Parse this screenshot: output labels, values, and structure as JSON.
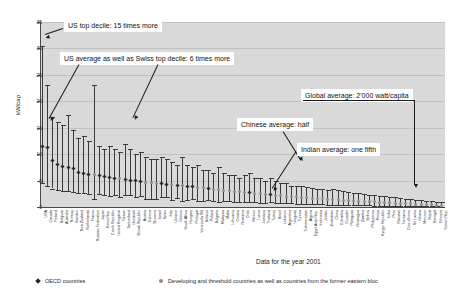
{
  "chart_data": {
    "type": "bar",
    "title": "",
    "subtitle": "",
    "xlabel": "",
    "ylabel": "kW/cap",
    "ylim": [
      0,
      35
    ],
    "yticks": [
      0,
      5,
      10,
      15,
      20,
      25,
      30,
      35
    ],
    "grid": true,
    "caption": "Data for the year 2001",
    "legend_position": "bottom",
    "series_note": "Each country shows an error bar from lower decile to top decile with a marker at the national average per-capita continuous power consumption.",
    "legend": [
      {
        "key": "oecd",
        "label": "OECD countries",
        "marker": "diamond",
        "color": "#2a2a2a"
      },
      {
        "key": "dev",
        "label": "Developing and threshold countries as well as countries from the former eastern bloc",
        "marker": "circle",
        "color": "#8c8c8c"
      }
    ],
    "categories": [
      "USA",
      "Canada",
      "Finland",
      "Belgium",
      "Australia",
      "Norway",
      "Sweden",
      "New Zealand",
      "Netherlands",
      "France",
      "Russian Federation",
      "Japan",
      "Korea Rep.",
      "Czech Republic",
      "United Kingdom",
      "Taiwan",
      "Switzerland",
      "Denmark",
      "Slovak Republic",
      "Austria",
      "Estonia",
      "Slovenia",
      "Israel",
      "Spain",
      "Italy",
      "Ukraine",
      "Greece",
      "South Africa",
      "Hungary",
      "Portugal",
      "Venezuela RB",
      "Belarus",
      "Poland",
      "Bulgaria",
      "Malaysia",
      "Malta",
      "Lithuania",
      "Croatia",
      "Romania",
      "Chile",
      "Mexico",
      "Latvia",
      "Jamaica",
      "Thailand",
      "Turkey",
      "Brazil",
      "Lebanon",
      "Argentina",
      "Uruguay",
      "Tunisia",
      "Turkmenistan",
      "Algeria",
      "Egypt Arab Rep.",
      "Indonesia",
      "Jordan",
      "Zimbabwe",
      "China",
      "Colombia",
      "Ecuador",
      "Paraguay",
      "Nicaragua",
      "Zambia",
      "Bolivia",
      "Philippines",
      "Kenya",
      "Kyrgyz Republic",
      "India",
      "Peru",
      "Pakistan",
      "Tanzania",
      "Cote d'Ivoire",
      "Sri Lanka",
      "Ghana",
      "Morocco",
      "Nepal",
      "Senegal",
      "Ethiopia",
      "Yemen Rep."
    ],
    "groups": [
      "oecd",
      "oecd",
      "oecd",
      "oecd",
      "oecd",
      "oecd",
      "oecd",
      "oecd",
      "oecd",
      "oecd",
      "dev",
      "oecd",
      "oecd",
      "oecd",
      "oecd",
      "dev",
      "oecd",
      "oecd",
      "oecd",
      "oecd",
      "dev",
      "dev",
      "dev",
      "oecd",
      "oecd",
      "dev",
      "oecd",
      "dev",
      "oecd",
      "oecd",
      "dev",
      "dev",
      "oecd",
      "dev",
      "dev",
      "dev",
      "dev",
      "dev",
      "dev",
      "dev",
      "oecd",
      "dev",
      "dev",
      "dev",
      "oecd",
      "dev",
      "dev",
      "dev",
      "dev",
      "dev",
      "dev",
      "dev",
      "dev",
      "dev",
      "dev",
      "dev",
      "dev",
      "dev",
      "dev",
      "dev",
      "dev",
      "dev",
      "dev",
      "dev",
      "dev",
      "dev",
      "dev",
      "dev",
      "dev",
      "dev",
      "dev",
      "dev",
      "dev",
      "dev",
      "dev",
      "dev",
      "dev",
      "dev"
    ],
    "mean": [
      11.5,
      11.2,
      8.8,
      8.0,
      7.6,
      7.5,
      7.2,
      6.6,
      6.4,
      6.2,
      6.1,
      5.9,
      5.7,
      5.6,
      5.4,
      5.3,
      5.2,
      5.1,
      5.0,
      4.9,
      4.7,
      4.6,
      4.5,
      4.4,
      4.3,
      4.2,
      4.1,
      4.0,
      3.9,
      3.8,
      3.7,
      3.6,
      3.5,
      3.4,
      3.3,
      3.2,
      3.1,
      3.0,
      2.9,
      2.8,
      2.7,
      2.6,
      2.5,
      2.4,
      2.3,
      2.2,
      2.1,
      2.0,
      1.95,
      1.9,
      1.85,
      1.8,
      1.7,
      1.65,
      1.6,
      1.5,
      1.45,
      1.4,
      1.3,
      1.25,
      1.2,
      1.1,
      1.05,
      1.0,
      0.95,
      0.9,
      0.85,
      0.8,
      0.75,
      0.7,
      0.65,
      0.6,
      0.55,
      0.5,
      0.45,
      0.4,
      0.35,
      0.3
    ],
    "upper_decile": [
      30.5,
      23.0,
      17.0,
      16.0,
      15.5,
      17.5,
      14.5,
      13.0,
      13.5,
      12.5,
      23.0,
      11.5,
      11.0,
      11.5,
      11.0,
      10.5,
      12.0,
      11.0,
      10.0,
      10.5,
      9.5,
      9.0,
      9.0,
      9.5,
      9.0,
      8.5,
      8.0,
      9.5,
      8.0,
      7.5,
      8.0,
      7.0,
      7.0,
      6.5,
      7.5,
      6.5,
      6.0,
      6.0,
      5.5,
      6.0,
      6.5,
      5.5,
      5.5,
      5.0,
      5.5,
      5.0,
      4.5,
      4.5,
      4.0,
      4.0,
      4.0,
      3.8,
      3.6,
      3.5,
      3.4,
      3.3,
      3.4,
      3.2,
      3.0,
      2.8,
      2.7,
      2.6,
      2.4,
      2.3,
      2.2,
      2.1,
      2.0,
      1.9,
      1.8,
      1.7,
      1.6,
      1.5,
      1.4,
      1.3,
      1.2,
      1.1,
      1.0,
      0.9
    ],
    "lower_decile": [
      4.5,
      4.0,
      3.5,
      3.2,
      3.0,
      3.0,
      2.9,
      2.7,
      2.6,
      2.5,
      1.6,
      2.4,
      2.2,
      2.0,
      2.2,
      1.9,
      2.3,
      2.2,
      1.8,
      2.0,
      1.5,
      1.6,
      1.6,
      1.8,
      1.8,
      1.4,
      1.7,
      1.2,
      1.4,
      1.6,
      1.2,
      1.2,
      1.3,
      1.1,
      1.0,
      1.2,
      1.1,
      1.0,
      1.0,
      0.9,
      1.0,
      0.9,
      0.8,
      0.8,
      0.9,
      0.8,
      0.7,
      0.7,
      0.7,
      0.6,
      0.6,
      0.6,
      0.55,
      0.5,
      0.5,
      0.45,
      0.45,
      0.45,
      0.4,
      0.4,
      0.35,
      0.35,
      0.3,
      0.3,
      0.28,
      0.26,
      0.25,
      0.24,
      0.22,
      0.2,
      0.2,
      0.18,
      0.17,
      0.15,
      0.14,
      0.12,
      0.1,
      0.08
    ],
    "annotations": [
      {
        "key": "us_top_decile",
        "text": "US top decile: 15 times more",
        "points_to": "USA upper decile"
      },
      {
        "key": "us_average",
        "text": "US average as well as Swiss top decile: 6 times more",
        "points_to": "USA average and Switzerland upper decile"
      },
      {
        "key": "global_average",
        "text": "Global average: 2'000 watt/capita",
        "points_to": "2 kW/cap level"
      },
      {
        "key": "chinese_average",
        "text": "Chinese average: half",
        "points_to": "China average"
      },
      {
        "key": "indian_average",
        "text": "Indian average: one fifth",
        "points_to": "India average"
      }
    ]
  }
}
